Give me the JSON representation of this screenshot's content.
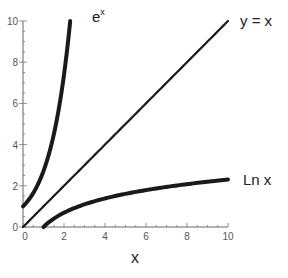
{
  "chart_data": {
    "type": "line",
    "title": "",
    "xlabel": "x",
    "ylabel": "",
    "xlim": [
      0,
      10
    ],
    "ylim": [
      0,
      10
    ],
    "grid": false,
    "x_ticks": [
      0,
      2,
      4,
      6,
      8,
      10
    ],
    "y_ticks": [
      0,
      2,
      4,
      6,
      8,
      10
    ],
    "origin_labels": [
      "0",
      "0"
    ],
    "series": [
      {
        "name": "e^x",
        "label_base": "e",
        "label_sup": "x",
        "function": "exp",
        "x": [
          0,
          0.5,
          1.0,
          1.5,
          2.0,
          2.303
        ],
        "y": [
          1,
          1.65,
          2.72,
          4.48,
          7.39,
          10
        ]
      },
      {
        "name": "y = x",
        "label": "y = x",
        "function": "identity",
        "x": [
          0,
          10
        ],
        "y": [
          0,
          10
        ]
      },
      {
        "name": "Ln x",
        "label": "Ln x",
        "function": "ln",
        "x": [
          1,
          2,
          4,
          6,
          8,
          10
        ],
        "y": [
          0,
          0.69,
          1.39,
          1.79,
          2.08,
          2.3
        ]
      }
    ],
    "line_color": "#1a1a1a"
  }
}
